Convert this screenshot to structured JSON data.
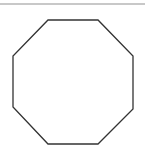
{
  "diagram": {
    "shape": "octagon",
    "stroke_color": "#333333",
    "fill_color": "#ffffff",
    "rule_color": "#c8c8c8",
    "vertices": [
      [
        48,
        20
      ],
      [
        98,
        20
      ],
      [
        133,
        56
      ],
      [
        133,
        109
      ],
      [
        98,
        144
      ],
      [
        48,
        144
      ],
      [
        13,
        107
      ],
      [
        13,
        56
      ]
    ]
  }
}
